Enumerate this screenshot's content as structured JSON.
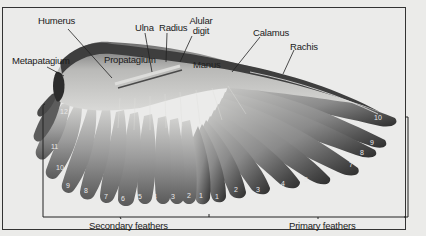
{
  "figure": {
    "labels": {
      "humerus": "Humerus",
      "ulna": "Ulna",
      "radius": "Radius",
      "alular_digit_line1": "Alular",
      "alular_digit_line2": "digit",
      "calamus": "Calamus",
      "rachis": "Rachis",
      "metapatagium": "Metapatagium",
      "propatagium": "Propatagium",
      "manus": "Manus"
    },
    "groups": {
      "secondary": "Secondary feathers",
      "primary": "Primary feathers"
    },
    "secondary_numbers": [
      "12",
      "11",
      "10",
      "9",
      "8",
      "7",
      "6",
      "5",
      "4",
      "3",
      "2",
      "1"
    ],
    "primary_numbers": [
      "1",
      "2",
      "3",
      "4",
      "5",
      "6",
      "7",
      "8",
      "9",
      "10"
    ],
    "colors": {
      "background": "#ebebea",
      "frame": "#333333",
      "feather_light": "#a9a9a9",
      "feather_dark": "#3a3a3a",
      "label_text": "#1a1a1a"
    }
  }
}
